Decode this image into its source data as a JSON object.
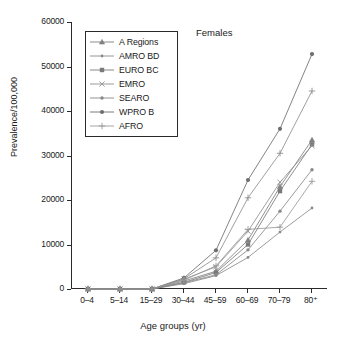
{
  "chart_data": {
    "type": "line",
    "title": "Females",
    "xlabel": "Age groups (yr)",
    "ylabel": "Prevalence/100,000",
    "categories": [
      "0–4",
      "5–14",
      "15–29",
      "30–44",
      "45–59",
      "60–69",
      "70–79",
      "80⁺"
    ],
    "ylim": [
      0,
      60000
    ],
    "yticks": [
      0,
      10000,
      20000,
      30000,
      40000,
      50000,
      60000
    ],
    "ytick_labels": [
      "0",
      "10000",
      "20000",
      "30000",
      "40000",
      "50000",
      "60000"
    ],
    "grid": false,
    "legend_position": "upper-left-inside",
    "series": [
      {
        "name": "A Regions",
        "marker": "triangle",
        "color": "#808080",
        "values": [
          0,
          0,
          0,
          1800,
          4000,
          11000,
          23000,
          33500
        ]
      },
      {
        "name": "AMRO BD",
        "marker": "small-dot",
        "color": "#8a8a8a",
        "values": [
          0,
          0,
          0,
          1200,
          3000,
          7100,
          12800,
          18200
        ]
      },
      {
        "name": "EURO BC",
        "marker": "square",
        "color": "#7a7a7a",
        "values": [
          0,
          0,
          0,
          1500,
          3700,
          10000,
          22000,
          32500
        ]
      },
      {
        "name": "EMRO",
        "marker": "cross-x",
        "color": "#909090",
        "values": [
          0,
          0,
          0,
          2200,
          5000,
          13000,
          24000,
          32200
        ]
      },
      {
        "name": "SEARO",
        "marker": "dot",
        "color": "#888888",
        "values": [
          0,
          0,
          0,
          1400,
          3200,
          8800,
          17500,
          26800
        ]
      },
      {
        "name": "WPRO B",
        "marker": "filled-circle",
        "color": "#6e6e6e",
        "values": [
          0,
          0,
          0,
          2500,
          8700,
          24500,
          36000,
          52800
        ]
      },
      {
        "name": "AFRO",
        "marker": "plus",
        "color": "#9a9a9a",
        "values": [
          0,
          0,
          0,
          2000,
          5200,
          13400,
          13900,
          24200
        ]
      }
    ],
    "extra_series_note": "",
    "second_steep": {
      "name": "WPRO B upper companion",
      "values": [
        0,
        0,
        0,
        2300,
        7000,
        20500,
        30500,
        44500
      ]
    }
  },
  "legend": {
    "items": [
      {
        "label": "A Regions"
      },
      {
        "label": "AMRO BD"
      },
      {
        "label": "EURO BC"
      },
      {
        "label": "EMRO"
      },
      {
        "label": "SEARO"
      },
      {
        "label": "WPRO B"
      },
      {
        "label": "AFRO"
      }
    ]
  }
}
